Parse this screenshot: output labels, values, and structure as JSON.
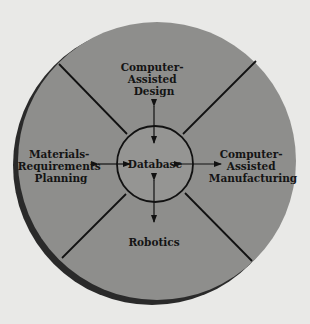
{
  "diagram": {
    "type": "hub-and-spoke",
    "center": {
      "label": "Database"
    },
    "nodes": [
      {
        "id": "cad",
        "lines": [
          "Computer-",
          "Assisted",
          "Design"
        ],
        "position": "top"
      },
      {
        "id": "cam",
        "lines": [
          "Computer-",
          "Assisted",
          "Manufacturing"
        ],
        "position": "right"
      },
      {
        "id": "robotics",
        "lines": [
          "Robotics"
        ],
        "position": "bottom"
      },
      {
        "id": "mrp",
        "lines": [
          "Materials-",
          "Requirements",
          "Planning"
        ],
        "position": "left"
      }
    ],
    "edges": [
      {
        "from": "Database",
        "to": "Computer-Assisted Design",
        "direction": "bidirectional"
      },
      {
        "from": "Database",
        "to": "Computer-Assisted Manufacturing",
        "direction": "bidirectional"
      },
      {
        "from": "Database",
        "to": "Robotics",
        "direction": "bidirectional"
      },
      {
        "from": "Database",
        "to": "Materials-Requirements Planning",
        "direction": "bidirectional"
      }
    ],
    "colors": {
      "background": "#e9e9e7",
      "disc": "#8e8e8c",
      "disc_shadow": "#2a2a2a",
      "inner_circle": "#959593",
      "lines": "#111111",
      "text": "#141414"
    }
  }
}
